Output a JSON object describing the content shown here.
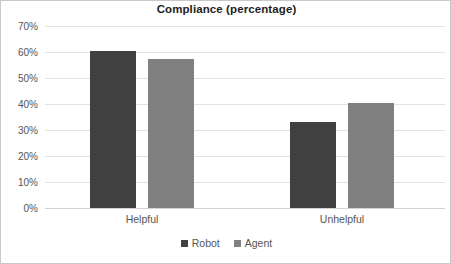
{
  "chart_data": {
    "type": "bar",
    "title": "Compliance (percentage)",
    "xlabel": "",
    "ylabel": "",
    "categories": [
      "Helpful",
      "Unhelpful"
    ],
    "series": [
      {
        "name": "Robot",
        "color": "#404040",
        "values": [
          60.5,
          33.0
        ]
      },
      {
        "name": "Agent",
        "color": "#808080",
        "values": [
          57.5,
          40.5
        ]
      }
    ],
    "ylim": [
      0,
      70
    ],
    "ytick_values": [
      0,
      10,
      20,
      30,
      40,
      50,
      60,
      70
    ],
    "ytick_labels": [
      "0%",
      "10%",
      "20%",
      "30%",
      "40%",
      "50%",
      "60%",
      "70%"
    ],
    "grid": true,
    "grid_axis": "y",
    "legend_position": "bottom-center",
    "legend_entries": [
      "Robot",
      "Agent"
    ],
    "bar_geometry": {
      "group_centers_px": [
        141,
        341
      ],
      "bar_width_px": 46,
      "bar_gap_px": 12
    }
  },
  "colors": {
    "background": "#ffffff",
    "border": "#c9c9c9",
    "gridline": "#e2e2e2",
    "baseline": "#d2d2d2",
    "title_text": "#222222",
    "axis_text": "#555555",
    "series_robot": "#404040",
    "series_agent": "#808080"
  }
}
